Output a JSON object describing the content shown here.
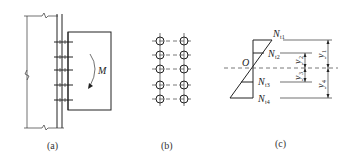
{
  "figure": {
    "panels": [
      {
        "id": "a",
        "caption": "(a)",
        "description": "bolted bracket connection to column flange under moment"
      },
      {
        "id": "b",
        "caption": "(b)",
        "description": "bolt layout, 2 columns x 5 rows"
      },
      {
        "id": "c",
        "caption": "(c)",
        "description": "linear bolt force distribution about neutral axis O"
      }
    ],
    "panel_a": {
      "moment_label": "M",
      "bolt_rows": 5
    },
    "panel_b": {
      "bolt_columns": 2,
      "bolt_rows": 5
    },
    "panel_c": {
      "origin_label": "O",
      "forces": [
        {
          "main": "N",
          "sub": "t1"
        },
        {
          "main": "N",
          "sub": "t2"
        },
        {
          "main": "N",
          "sub": "t3"
        },
        {
          "main": "N",
          "sub": "t4"
        }
      ],
      "dimensions": [
        {
          "main": "y",
          "sub": "1"
        },
        {
          "main": "y",
          "sub": "2"
        },
        {
          "main": "y",
          "sub": "3"
        },
        {
          "main": "y",
          "sub": "4"
        }
      ]
    }
  }
}
